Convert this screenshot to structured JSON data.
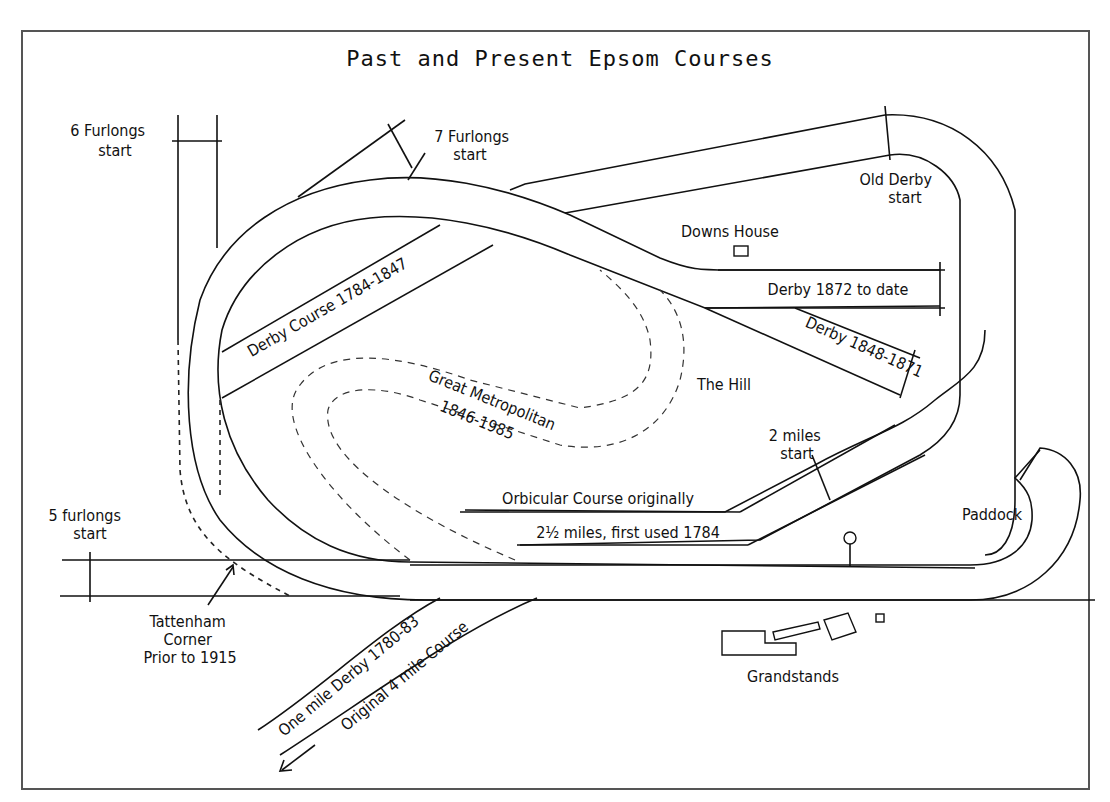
{
  "title": "Past and Present Epsom Courses",
  "labels": {
    "six_furlongs": [
      "6 Furlongs",
      "start"
    ],
    "seven_furlongs": [
      "7 Furlongs",
      "start"
    ],
    "old_derby": [
      "Old Derby",
      "start"
    ],
    "downs_house": "Downs House",
    "derby_1872": "Derby 1872 to date",
    "derby_1848": "Derby 1848-1871",
    "derby_course_1784": "Derby Course 1784-1847",
    "great_metropolitan": "Great Metropolitan",
    "great_metropolitan_years": "1846-1985",
    "the_hill": "The Hill",
    "two_miles": [
      "2 miles",
      "start"
    ],
    "orbicular_1": "Orbicular Course originally",
    "orbicular_2": "2½ miles, first used 1784",
    "paddock": "Paddock",
    "five_furlongs": [
      "5 furlongs",
      "start"
    ],
    "tattenham": [
      "Tattenham",
      "Corner",
      "Prior to 1915"
    ],
    "one_mile_derby": "One mile Derby 1780-83",
    "original_4_mile": "Original 4 mile Course",
    "grandstands": "Grandstands"
  },
  "colors": {
    "line": "#111111",
    "frame": "#555555",
    "background": "#ffffff"
  }
}
